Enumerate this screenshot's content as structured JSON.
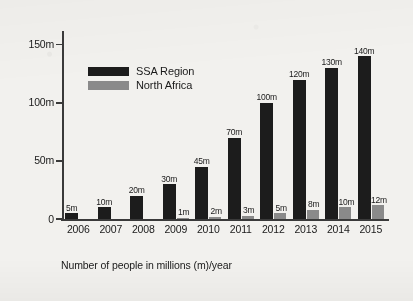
{
  "chart_data": {
    "type": "bar",
    "title": "",
    "subtitle": "",
    "caption": "Number of people in millions (m)/year",
    "xlabel": "",
    "ylabel": "",
    "categories": [
      "2006",
      "2007",
      "2008",
      "2009",
      "2010",
      "2011",
      "2012",
      "2013",
      "2014",
      "2015"
    ],
    "series": [
      {
        "name": "SSA Region",
        "color": "#1c1c1c",
        "values": [
          5,
          10,
          20,
          30,
          45,
          70,
          100,
          120,
          130,
          140
        ],
        "labels": [
          "5m",
          "10m",
          "20m",
          "30m",
          "45m",
          "70m",
          "100m",
          "120m",
          "130m",
          "140m"
        ]
      },
      {
        "name": "North Africa",
        "color": "#8a8a8a",
        "values": [
          0,
          0,
          0,
          1,
          2,
          3,
          5,
          8,
          10,
          12
        ],
        "labels": [
          "",
          "",
          "",
          "1m",
          "2m",
          "3m",
          "5m",
          "8m",
          "10m",
          "12m"
        ]
      }
    ],
    "ylim": [
      0,
      160
    ],
    "yticks": [
      0,
      50,
      100,
      150
    ],
    "ytick_labels": [
      "0",
      "50m",
      "100m",
      "150m"
    ],
    "grid": false,
    "legend_position": "upper-left-inside"
  },
  "legend": {
    "items": [
      {
        "label": "SSA Region",
        "swatch": "ssa"
      },
      {
        "label": "North Africa",
        "swatch": "na"
      }
    ]
  }
}
